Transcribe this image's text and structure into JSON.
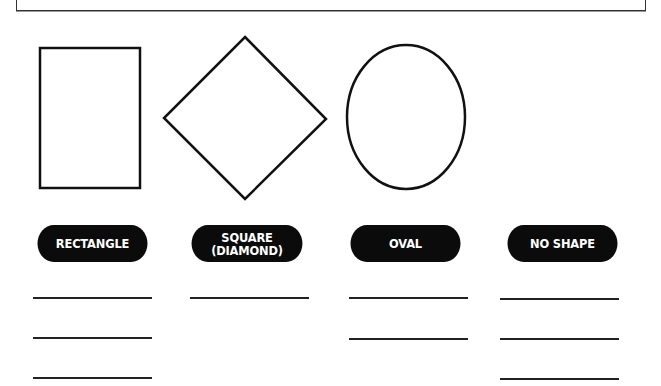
{
  "worksheet": {
    "shapes": [
      {
        "name": "rectangle",
        "kind": "rectangle"
      },
      {
        "name": "diamond",
        "kind": "diamond"
      },
      {
        "name": "oval",
        "kind": "oval"
      }
    ],
    "categories": [
      {
        "label": "RECTANGLE",
        "answer_lines": 3
      },
      {
        "label": "SQUARE\n(DIAMOND)",
        "answer_lines": 1
      },
      {
        "label": "OVAL",
        "answer_lines": 2
      },
      {
        "label": "NO SHAPE",
        "answer_lines": 3
      }
    ]
  }
}
